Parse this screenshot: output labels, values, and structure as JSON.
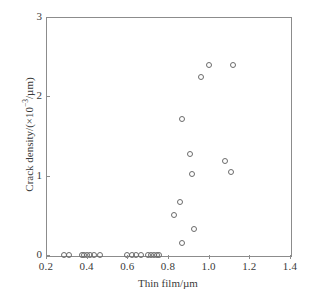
{
  "figure": {
    "background_color": "#ffffff",
    "frame_color": "#8c8c8c",
    "marker_color": "#6b6b6b"
  },
  "axes": {
    "x": {
      "label": "Thin film/µm",
      "tick_labels": [
        "0.2",
        "0.4",
        "0.6",
        "0.8",
        "1.0",
        "1.2",
        "1.4"
      ],
      "tick_values": [
        0.2,
        0.4,
        0.6,
        0.8,
        1.0,
        1.2,
        1.4
      ],
      "min": 0.2,
      "max": 1.4
    },
    "y": {
      "label_prefix": "Crack density/(×10",
      "label_exponent": "−3",
      "label_suffix": "/µm)",
      "tick_labels": [
        "0",
        "1",
        "2",
        "3"
      ],
      "tick_values": [
        0,
        1,
        2,
        3
      ],
      "min": 0,
      "max": 3
    }
  },
  "caption": {
    "text": ""
  },
  "chart_data": {
    "type": "scatter",
    "title": "",
    "subtitle": "",
    "xlabel": "Thin film/µm",
    "ylabel": "Crack density/(×10⁻³/µm)",
    "xlim": [
      0.2,
      1.4
    ],
    "ylim": [
      0,
      3
    ],
    "grid": false,
    "legend": null,
    "marker": "open-circle",
    "series": [
      {
        "name": "Crack density vs thin film thickness",
        "points": [
          {
            "x": 0.29,
            "y": 0.0
          },
          {
            "x": 0.315,
            "y": 0.0
          },
          {
            "x": 0.375,
            "y": 0.0
          },
          {
            "x": 0.385,
            "y": 0.0
          },
          {
            "x": 0.4,
            "y": 0.0
          },
          {
            "x": 0.415,
            "y": 0.0
          },
          {
            "x": 0.435,
            "y": 0.0
          },
          {
            "x": 0.465,
            "y": 0.0
          },
          {
            "x": 0.6,
            "y": 0.0
          },
          {
            "x": 0.625,
            "y": 0.0
          },
          {
            "x": 0.645,
            "y": 0.0
          },
          {
            "x": 0.665,
            "y": 0.0
          },
          {
            "x": 0.7,
            "y": 0.0
          },
          {
            "x": 0.715,
            "y": 0.0
          },
          {
            "x": 0.73,
            "y": 0.0
          },
          {
            "x": 0.745,
            "y": 0.0
          },
          {
            "x": 0.755,
            "y": 0.0
          },
          {
            "x": 0.87,
            "y": 0.15
          },
          {
            "x": 0.93,
            "y": 0.33
          },
          {
            "x": 0.83,
            "y": 0.5
          },
          {
            "x": 0.86,
            "y": 0.67
          },
          {
            "x": 0.92,
            "y": 1.02
          },
          {
            "x": 1.11,
            "y": 1.05
          },
          {
            "x": 1.08,
            "y": 1.19
          },
          {
            "x": 0.91,
            "y": 1.27
          },
          {
            "x": 0.87,
            "y": 1.72
          },
          {
            "x": 0.96,
            "y": 2.24
          },
          {
            "x": 1.0,
            "y": 2.4
          },
          {
            "x": 1.12,
            "y": 2.39
          }
        ]
      }
    ]
  }
}
